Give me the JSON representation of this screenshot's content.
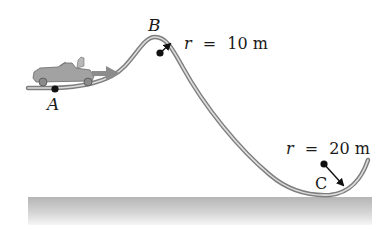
{
  "diagram": {
    "type": "physics-roller-coaster-track",
    "points": [
      {
        "id": "A",
        "label": "A"
      },
      {
        "id": "B",
        "label": "B"
      },
      {
        "id": "C",
        "label": "C"
      }
    ],
    "radius_labels": [
      {
        "at": "B",
        "var": "r",
        "eq": "=",
        "value": "10 m"
      },
      {
        "at": "C",
        "var": "r",
        "eq": "=",
        "value": "20 m"
      }
    ],
    "objects": {
      "vehicle": "go-kart-with-driver",
      "velocity_arrow": "velocity-arrow"
    },
    "colors": {
      "track": "#8a8a8a",
      "track_inner": "#d8d8d8",
      "ground_top": "#b8b8b8",
      "ground_bottom": "#f4f4f4",
      "vehicle": "#9a9a9a",
      "arrow": "#8c8c8c",
      "dot": "#111111",
      "text": "#1a1a1a"
    }
  }
}
